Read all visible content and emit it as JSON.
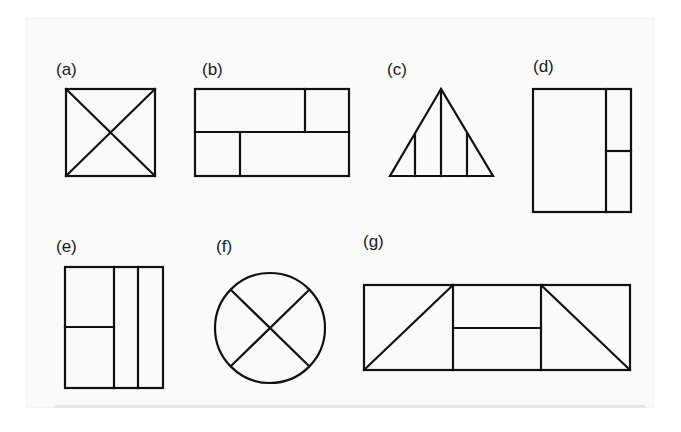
{
  "labels": {
    "a": "(a)",
    "b": "(b)",
    "c": "(c)",
    "d": "(d)",
    "e": "(e)",
    "f": "(f)",
    "g": "(g)"
  },
  "figures": [
    {
      "id": "a",
      "shape": "square with both diagonals"
    },
    {
      "id": "b",
      "shape": "rectangle split horizontally, top divided right, bottom divided left"
    },
    {
      "id": "c",
      "shape": "triangle with three vertical lines"
    },
    {
      "id": "d",
      "shape": "tall rectangle with narrow right strip split horizontally"
    },
    {
      "id": "e",
      "shape": "tall rectangle with two right strips, left part split horizontally"
    },
    {
      "id": "f",
      "shape": "circle with X"
    },
    {
      "id": "g",
      "shape": "wide rectangle in three parts: diagonal, horizontal split, diagonal"
    }
  ],
  "colors": {
    "line": "#111111",
    "background": "#ffffff"
  }
}
